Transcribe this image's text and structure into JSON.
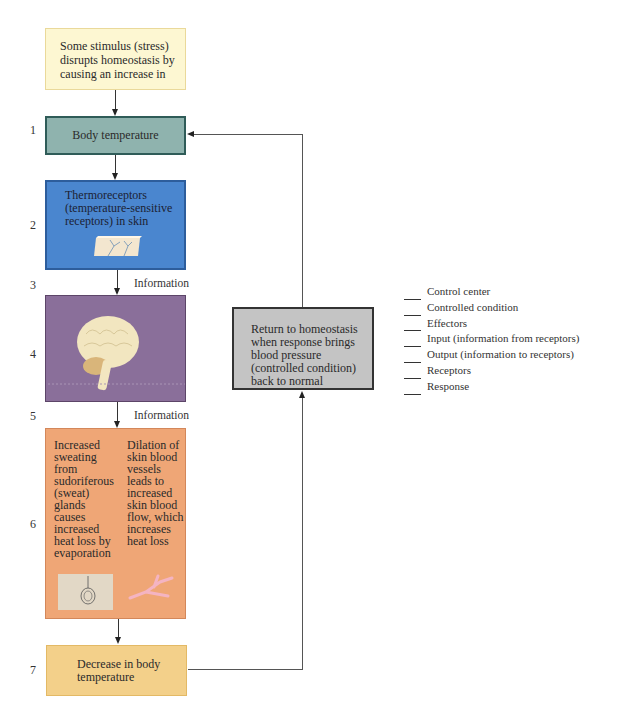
{
  "stimulus": {
    "text": "Some stimulus (stress) disrupts homeostasis by causing an increase in"
  },
  "steps": [
    {
      "number": "1",
      "label": "Body temperature"
    },
    {
      "number": "2",
      "label": "Thermoreceptors (temperature-sensitive receptors) in skin"
    },
    {
      "number": "3",
      "label": "Information"
    },
    {
      "number": "4",
      "label": ""
    },
    {
      "number": "5",
      "label": "Information"
    },
    {
      "number": "6",
      "left_text": "Increased\nsweating\nfrom\nsudoriferous\n(sweat)\nglands\ncauses\nincreased\nheat loss by\nevaporation",
      "right_text": "Dilation of\nskin blood\nvessels\nleads to\nincreased\nskin blood\nflow, which\nincreases\nheat loss"
    },
    {
      "number": "7",
      "label": "Decrease in body temperature"
    }
  ],
  "homeostasis": {
    "text": "Return to homeostasis when response brings blood pressure (controlled condition) back to normal"
  },
  "legend": {
    "items": [
      "Control center",
      "Controlled condition",
      "Effectors",
      "Input (information from receptors)",
      "Output (information to receptors)",
      "Receptors",
      "Response"
    ]
  },
  "colors": {
    "stimulus": "#fdf7d2",
    "body_temperature": "#8fb3ae",
    "receptors": "#4a86cf",
    "control_center": "#8a6f9a",
    "effectors": "#efa676",
    "decrease": "#f3d08a",
    "homeostasis": "#c4c4c4"
  }
}
